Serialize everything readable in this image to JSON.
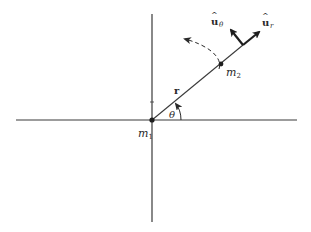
{
  "diagram": {
    "colors": {
      "ink": "#2a2a2a",
      "axis": "#3a3a3a",
      "background": "#ffffff"
    },
    "labels": {
      "m1": {
        "base": "m",
        "sub": "1"
      },
      "m2": {
        "base": "m",
        "sub": "2"
      },
      "r": "r",
      "theta": "θ",
      "u_theta": {
        "base": "u",
        "hat": "^",
        "sub": "θ"
      },
      "u_r": {
        "base": "u",
        "hat": "^",
        "sub": "r"
      }
    },
    "points": {
      "origin_m1": [
        152,
        120
      ],
      "m2": [
        221,
        64
      ],
      "arrow_base": [
        243,
        45
      ]
    },
    "axes": {
      "horizontal": {
        "from": [
          16,
          120
        ],
        "to": [
          297,
          120
        ]
      },
      "vertical": {
        "from": [
          152,
          14
        ],
        "to": [
          152,
          222
        ]
      }
    }
  }
}
